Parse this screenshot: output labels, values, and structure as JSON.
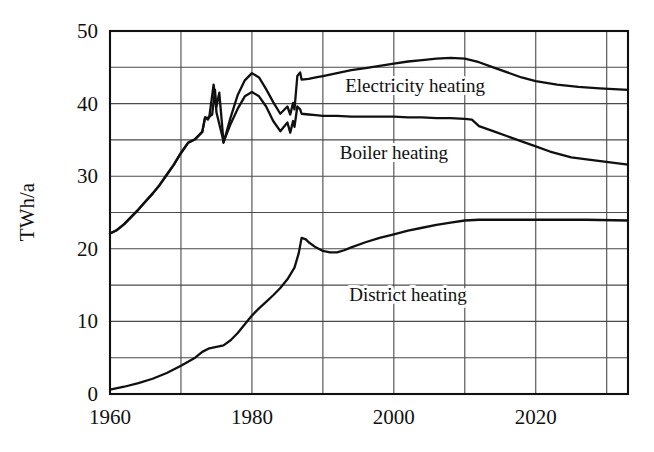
{
  "chart_data": {
    "type": "line",
    "title": "",
    "xlabel": "",
    "ylabel": "TWh/a",
    "xlim": [
      1960,
      2033
    ],
    "ylim": [
      0,
      50
    ],
    "grid": true,
    "grid_x_step": 10,
    "grid_y_step": 5,
    "legend_position": "inline-annotations",
    "x_tick_labels": [
      "1960",
      "1980",
      "2000",
      "2020"
    ],
    "x_tick_values": [
      1960,
      1980,
      2000,
      2020
    ],
    "x_gridline_values": [
      1960,
      1970,
      1980,
      1990,
      2000,
      2010,
      2020,
      2030
    ],
    "y_tick_labels": [
      "0",
      "10",
      "20",
      "30",
      "40",
      "50"
    ],
    "y_tick_values": [
      0,
      10,
      20,
      30,
      40,
      50
    ],
    "y_gridline_values": [
      0,
      5,
      10,
      15,
      20,
      25,
      30,
      35,
      40,
      45,
      50
    ],
    "line_color": "#101010",
    "grid_color": "#4a4a4a",
    "axis_color": "#101010",
    "series": [
      {
        "name": "Electricity heating",
        "label_x": 2003,
        "label_y": 41.6,
        "points": [
          [
            1960,
            22.1
          ],
          [
            1961,
            22.6
          ],
          [
            1962,
            23.4
          ],
          [
            1963,
            24.4
          ],
          [
            1964,
            25.4
          ],
          [
            1965,
            26.5
          ],
          [
            1966,
            27.6
          ],
          [
            1967,
            28.8
          ],
          [
            1968,
            30.2
          ],
          [
            1969,
            31.6
          ],
          [
            1970,
            33.2
          ],
          [
            1971,
            34.6
          ],
          [
            1972,
            35.1
          ],
          [
            1973,
            36.1
          ],
          [
            1973.4,
            38.1
          ],
          [
            1973.8,
            38.0
          ],
          [
            1974,
            38.2
          ],
          [
            1974.6,
            42.6
          ],
          [
            1975,
            39.6
          ],
          [
            1975.4,
            41.5
          ],
          [
            1975.8,
            37.0
          ],
          [
            1976,
            34.6
          ],
          [
            1977,
            38.1
          ],
          [
            1978,
            41.2
          ],
          [
            1979,
            43.2
          ],
          [
            1980,
            44.2
          ],
          [
            1981,
            43.6
          ],
          [
            1982,
            42.0
          ],
          [
            1983,
            40.2
          ],
          [
            1984,
            38.6
          ],
          [
            1985,
            39.6
          ],
          [
            1985.4,
            38.5
          ],
          [
            1985.8,
            40.1
          ],
          [
            1986,
            39.2
          ],
          [
            1986.4,
            43.8
          ],
          [
            1986.8,
            44.3
          ],
          [
            1987,
            43.3
          ],
          [
            1988,
            43.4
          ],
          [
            1989,
            43.6
          ],
          [
            1990,
            43.8
          ],
          [
            1992,
            44.2
          ],
          [
            1994,
            44.6
          ],
          [
            1996,
            44.9
          ],
          [
            1998,
            45.2
          ],
          [
            2000,
            45.5
          ],
          [
            2002,
            45.8
          ],
          [
            2004,
            46.0
          ],
          [
            2006,
            46.2
          ],
          [
            2008,
            46.3
          ],
          [
            2010,
            46.2
          ],
          [
            2012,
            45.7
          ],
          [
            2014,
            45.0
          ],
          [
            2016,
            44.3
          ],
          [
            2018,
            43.6
          ],
          [
            2020,
            43.1
          ],
          [
            2023,
            42.6
          ],
          [
            2026,
            42.3
          ],
          [
            2029,
            42.1
          ],
          [
            2033,
            41.9
          ]
        ]
      },
      {
        "name": "Boiler heating",
        "label_x": 2000,
        "label_y": 32.4,
        "points": [
          [
            1960,
            22.1
          ],
          [
            1961,
            22.6
          ],
          [
            1962,
            23.4
          ],
          [
            1963,
            24.4
          ],
          [
            1964,
            25.4
          ],
          [
            1965,
            26.5
          ],
          [
            1966,
            27.6
          ],
          [
            1967,
            28.8
          ],
          [
            1968,
            30.2
          ],
          [
            1969,
            31.6
          ],
          [
            1970,
            33.2
          ],
          [
            1971,
            34.6
          ],
          [
            1972,
            35.1
          ],
          [
            1973,
            36.1
          ],
          [
            1973.4,
            38.1
          ],
          [
            1973.8,
            37.8
          ],
          [
            1974,
            38.2
          ],
          [
            1974.4,
            38.5
          ],
          [
            1974.8,
            41.9
          ],
          [
            1975,
            38.8
          ],
          [
            1975.4,
            37.2
          ],
          [
            1975.8,
            35.6
          ],
          [
            1976,
            34.7
          ],
          [
            1977,
            37.2
          ],
          [
            1978,
            39.3
          ],
          [
            1979,
            41.0
          ],
          [
            1980,
            41.6
          ],
          [
            1981,
            41.0
          ],
          [
            1982,
            39.6
          ],
          [
            1983,
            37.6
          ],
          [
            1984,
            36.2
          ],
          [
            1985,
            37.4
          ],
          [
            1985.4,
            36.0
          ],
          [
            1985.8,
            37.6
          ],
          [
            1986,
            36.8
          ],
          [
            1986.4,
            39.6
          ],
          [
            1986.8,
            39.2
          ],
          [
            1987,
            38.6
          ],
          [
            1988,
            38.5
          ],
          [
            1989,
            38.4
          ],
          [
            1990,
            38.3
          ],
          [
            1992,
            38.3
          ],
          [
            1994,
            38.2
          ],
          [
            1996,
            38.2
          ],
          [
            1998,
            38.2
          ],
          [
            2000,
            38.2
          ],
          [
            2002,
            38.1
          ],
          [
            2004,
            38.1
          ],
          [
            2006,
            38.0
          ],
          [
            2008,
            38.0
          ],
          [
            2010,
            37.9
          ],
          [
            2011,
            37.8
          ],
          [
            2012,
            36.9
          ],
          [
            2014,
            36.2
          ],
          [
            2016,
            35.5
          ],
          [
            2018,
            34.8
          ],
          [
            2020,
            34.1
          ],
          [
            2022,
            33.4
          ],
          [
            2025,
            32.6
          ],
          [
            2028,
            32.2
          ],
          [
            2033,
            31.6
          ]
        ]
      },
      {
        "name": "District heating",
        "label_x": 2002,
        "label_y": 12.8,
        "points": [
          [
            1960,
            0.6
          ],
          [
            1962,
            1.0
          ],
          [
            1964,
            1.5
          ],
          [
            1966,
            2.1
          ],
          [
            1968,
            2.9
          ],
          [
            1970,
            3.9
          ],
          [
            1972,
            5.0
          ],
          [
            1973,
            5.8
          ],
          [
            1974,
            6.3
          ],
          [
            1975,
            6.5
          ],
          [
            1976,
            6.7
          ],
          [
            1977,
            7.4
          ],
          [
            1978,
            8.4
          ],
          [
            1979,
            9.6
          ],
          [
            1980,
            10.8
          ],
          [
            1981,
            11.8
          ],
          [
            1982,
            12.7
          ],
          [
            1983,
            13.6
          ],
          [
            1984,
            14.6
          ],
          [
            1985,
            15.8
          ],
          [
            1986,
            17.4
          ],
          [
            1986.6,
            19.4
          ],
          [
            1987,
            21.5
          ],
          [
            1987.6,
            21.3
          ],
          [
            1988,
            20.9
          ],
          [
            1989,
            20.2
          ],
          [
            1990,
            19.7
          ],
          [
            1991,
            19.5
          ],
          [
            1992,
            19.5
          ],
          [
            1993,
            19.8
          ],
          [
            1994,
            20.2
          ],
          [
            1996,
            20.9
          ],
          [
            1998,
            21.5
          ],
          [
            2000,
            22.0
          ],
          [
            2002,
            22.5
          ],
          [
            2004,
            22.9
          ],
          [
            2006,
            23.3
          ],
          [
            2008,
            23.6
          ],
          [
            2010,
            23.9
          ],
          [
            2012,
            24.0
          ],
          [
            2014,
            24.0
          ],
          [
            2018,
            24.0
          ],
          [
            2022,
            24.0
          ],
          [
            2027,
            24.0
          ],
          [
            2033,
            23.9
          ]
        ]
      }
    ]
  },
  "figure": {
    "plot_left_px": 110,
    "plot_right_px": 628,
    "plot_top_px": 31,
    "plot_bottom_px": 394
  }
}
